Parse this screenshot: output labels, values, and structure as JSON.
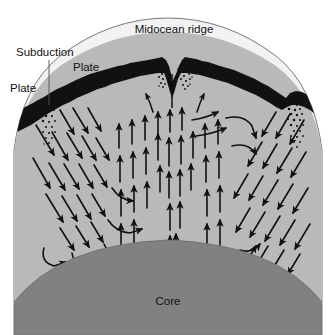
{
  "figure": {
    "type": "cross-section-diagram",
    "background_color": "#ffffff",
    "labels": {
      "midocean_ridge": "Midocean ridge",
      "subduction": "Subduction",
      "plate_left": "Plate",
      "plate_right": "Plate",
      "core": "Core"
    },
    "colors": {
      "background": "#ffffff",
      "ocean": "#f2f2f2",
      "mantle": "#b9b9b9",
      "core": "#818181",
      "crust": "#111111",
      "arrow": "#111111",
      "outline": "#555555"
    },
    "layers": [
      {
        "name": "ocean-surface-arc",
        "color": "#f2f2f2"
      },
      {
        "name": "lithosphere-crust",
        "color": "#111111"
      },
      {
        "name": "mantle",
        "color": "#b9b9b9"
      },
      {
        "name": "core",
        "color": "#818181"
      }
    ],
    "features": [
      {
        "name": "midocean-ridge-rift",
        "position": "center",
        "description": "V-shaped spreading rift with stippled magma zones"
      },
      {
        "name": "subduction-zone-left",
        "position": "left-flank",
        "description": "Downgoing slab with stippled melt"
      },
      {
        "name": "subduction-zone-right",
        "position": "right-flank",
        "description": "Downgoing slab with stippled melt"
      },
      {
        "name": "convection-cell-left",
        "description": "Descending limb on far left, ascending limb toward centre"
      },
      {
        "name": "convection-cell-right",
        "description": "Descending limb on far right, ascending limb toward centre"
      },
      {
        "name": "central-upwelling-plume",
        "description": "Vertical ascending arrows beneath the midocean ridge"
      }
    ]
  }
}
